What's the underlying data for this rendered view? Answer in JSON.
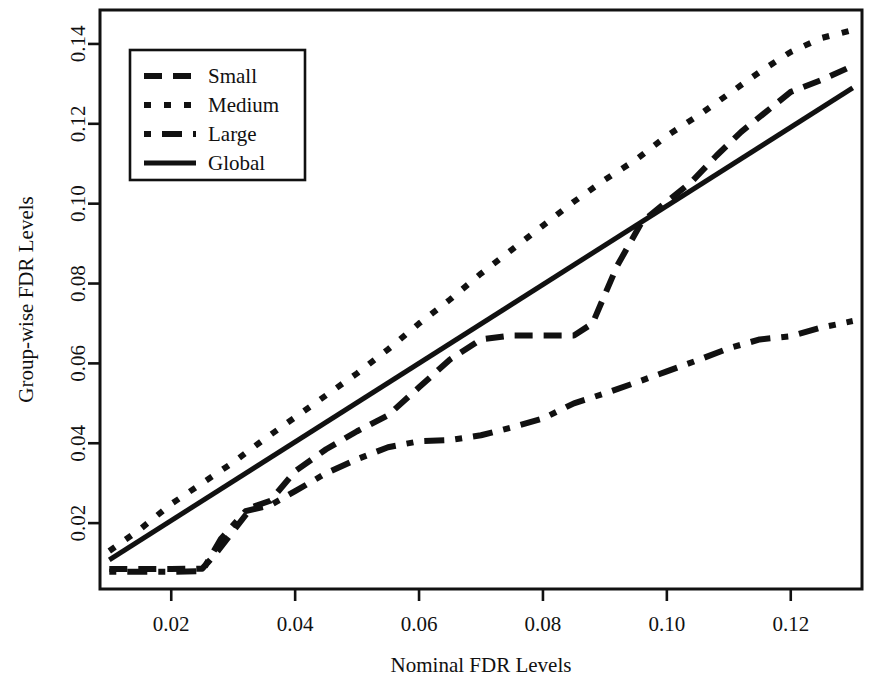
{
  "chart_data": {
    "type": "line",
    "title": "",
    "xlabel": "Nominal FDR Levels",
    "ylabel": "Group-wise FDR Levels",
    "xlim": [
      0.0085,
      0.1315
    ],
    "ylim": [
      0.0035,
      0.1485
    ],
    "grid": false,
    "xticks": [
      0.02,
      0.04,
      0.06,
      0.08,
      0.1,
      0.12
    ],
    "xticklabels": [
      "0.02",
      "0.04",
      "0.06",
      "0.08",
      "0.10",
      "0.12"
    ],
    "yticks": [
      0.02,
      0.04,
      0.06,
      0.08,
      0.1,
      0.12,
      0.14
    ],
    "yticklabels": [
      "0.02",
      "0.04",
      "0.06",
      "0.08",
      "0.10",
      "0.12",
      "0.14"
    ],
    "legend": {
      "position": "top-left",
      "entries": [
        "Small",
        "Medium",
        "Large",
        "Global"
      ]
    },
    "series": [
      {
        "name": "Small",
        "style": "dashed",
        "dash": "18 11",
        "width": 6,
        "x": [
          0.01,
          0.015,
          0.02,
          0.025,
          0.027,
          0.03,
          0.033,
          0.036,
          0.04,
          0.045,
          0.05,
          0.055,
          0.06,
          0.065,
          0.07,
          0.075,
          0.08,
          0.085,
          0.088,
          0.092,
          0.096,
          0.1,
          0.104,
          0.108,
          0.112,
          0.116,
          0.12,
          0.125,
          0.13
        ],
        "y": [
          0.0085,
          0.0085,
          0.0085,
          0.0086,
          0.012,
          0.018,
          0.024,
          0.0256,
          0.033,
          0.0385,
          0.043,
          0.047,
          0.054,
          0.061,
          0.066,
          0.067,
          0.067,
          0.067,
          0.07,
          0.0845,
          0.0955,
          0.1005,
          0.1055,
          0.112,
          0.118,
          0.123,
          0.128,
          0.131,
          0.1345
        ]
      },
      {
        "name": "Medium",
        "style": "dotted",
        "dash": "7 13",
        "width": 6,
        "x": [
          0.01,
          0.015,
          0.02,
          0.025,
          0.03,
          0.035,
          0.04,
          0.045,
          0.05,
          0.055,
          0.06,
          0.065,
          0.07,
          0.075,
          0.08,
          0.085,
          0.09,
          0.095,
          0.1,
          0.105,
          0.11,
          0.115,
          0.12,
          0.125,
          0.13
        ],
        "y": [
          0.013,
          0.0185,
          0.0248,
          0.03,
          0.0352,
          0.041,
          0.0465,
          0.052,
          0.0575,
          0.0635,
          0.07,
          0.076,
          0.0825,
          0.0885,
          0.0945,
          0.1005,
          0.106,
          0.111,
          0.117,
          0.122,
          0.1275,
          0.133,
          0.138,
          0.1415,
          0.1435
        ]
      },
      {
        "name": "Large",
        "style": "dashdot",
        "dash": "7 11 20 11",
        "width": 6,
        "x": [
          0.01,
          0.015,
          0.02,
          0.025,
          0.028,
          0.032,
          0.036,
          0.04,
          0.045,
          0.05,
          0.055,
          0.06,
          0.065,
          0.07,
          0.075,
          0.08,
          0.085,
          0.09,
          0.095,
          0.1,
          0.105,
          0.11,
          0.115,
          0.12,
          0.125,
          0.13
        ],
        "y": [
          0.0078,
          0.0078,
          0.0078,
          0.008,
          0.016,
          0.023,
          0.0245,
          0.028,
          0.0325,
          0.036,
          0.039,
          0.0405,
          0.0408,
          0.042,
          0.044,
          0.0462,
          0.05,
          0.0525,
          0.0552,
          0.058,
          0.0608,
          0.0638,
          0.066,
          0.0668,
          0.069,
          0.0706
        ]
      },
      {
        "name": "Global",
        "style": "solid",
        "dash": "",
        "width": 5,
        "x": [
          0.01,
          0.13
        ],
        "y": [
          0.0108,
          0.129
        ]
      }
    ]
  }
}
